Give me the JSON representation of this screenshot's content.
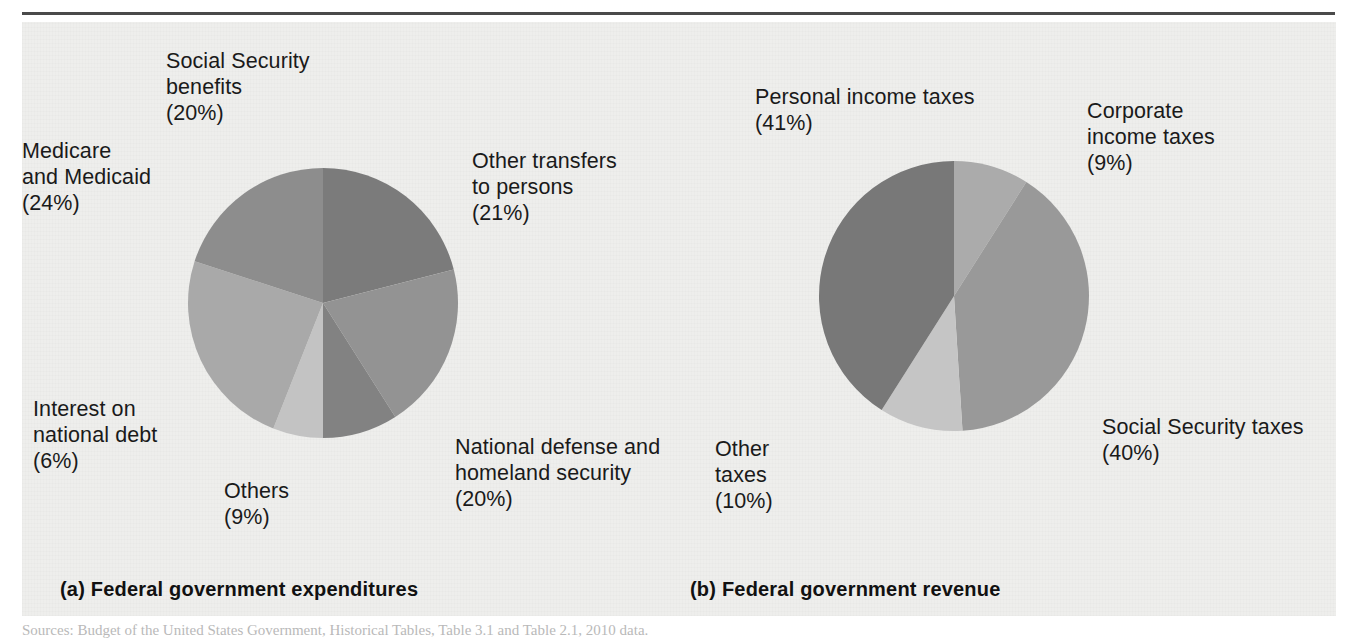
{
  "figure": {
    "background_color": "#eeeeec",
    "rule_color": "#4a4a4a"
  },
  "source_note": "Sources: Budget of the United States Government, Historical Tables, Table 3.1 and Table 2.1, 2010 data.",
  "panels": {
    "a": {
      "caption": "(a) Federal government expenditures"
    },
    "b": {
      "caption": "(b) Federal government revenue"
    }
  },
  "labels": {
    "a": {
      "social_security": "Social Security\nbenefits\n(20%)",
      "medicare": "Medicare\nand Medicaid\n(24%)",
      "interest": "Interest on\nnational debt\n(6%)",
      "others": "Others\n(9%)",
      "other_transfers": "Other transfers\nto persons\n(21%)",
      "national_defense": "National defense and\nhomeland security\n(20%)"
    },
    "b": {
      "personal_income": "Personal income taxes\n(41%)",
      "corporate_income": "Corporate\nincome taxes\n(9%)",
      "social_security": "Social Security taxes\n(40%)",
      "other_taxes": "Other\ntaxes\n(10%)"
    }
  },
  "chart_data": [
    {
      "type": "pie",
      "id": "federal-expenditures",
      "title": "(a) Federal government expenditures",
      "unit": "percent",
      "start_angle_deg": 0,
      "direction": "clockwise",
      "legend": "labels placed outside slices",
      "categories": [
        "Other transfers to persons",
        "National defense and homeland security",
        "Others",
        "Interest on national debt",
        "Medicare and Medicaid",
        "Social Security benefits"
      ],
      "values": [
        21,
        20,
        9,
        6,
        24,
        20
      ],
      "colors": [
        "#7b7b7b",
        "#939393",
        "#828282",
        "#c3c3c3",
        "#a9a9a9",
        "#8d8d8d"
      ]
    },
    {
      "type": "pie",
      "id": "federal-revenue",
      "title": "(b) Federal government revenue",
      "unit": "percent",
      "start_angle_deg": 0,
      "direction": "clockwise",
      "legend": "labels placed outside slices",
      "categories": [
        "Corporate income taxes",
        "Social Security taxes",
        "Other taxes",
        "Personal income taxes"
      ],
      "values": [
        9,
        40,
        10,
        41
      ],
      "colors": [
        "#ababab",
        "#999999",
        "#c5c5c5",
        "#787878"
      ]
    }
  ]
}
